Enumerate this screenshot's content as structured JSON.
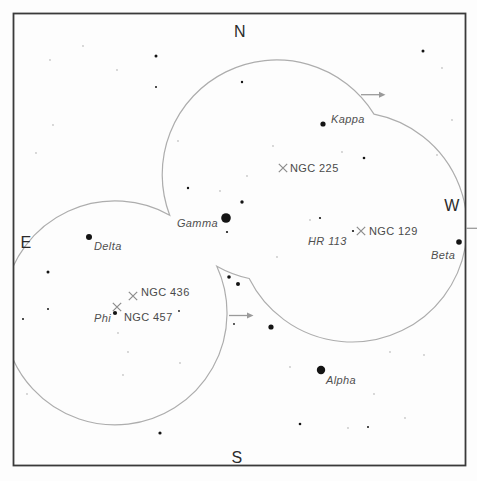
{
  "chart_title": "",
  "compass": {
    "north": "N",
    "south": "S",
    "east": "E",
    "west": "W"
  },
  "colors": {
    "background": "#fdfdfd",
    "border": "#3a3a3a",
    "fov_circle": "#adadad",
    "arrow": "#9a9a9a",
    "x_marker": "#8c8c8c",
    "star": "#141414",
    "faint_star": "#c6c6c6",
    "star_label": "#4f4f4f",
    "dso_label": "#4a4a4a",
    "compass_label": "#2b2b2b"
  },
  "fov": {
    "description": "three overlapping finder-field circles drawn as union outline",
    "circles": [
      {
        "cx": 273,
        "cy": 167,
        "r": 114
      },
      {
        "cx": 115,
        "cy": 313,
        "r": 112
      },
      {
        "cx": 352,
        "cy": 227,
        "r": 115
      }
    ],
    "outline_path": "M 169.7 215.2 A 114.5 114.5 0 0 1 374 114.1 A 115 115 0 1 1 249.2 278.5 A 114 114 0 0 1 216.8 266.2 A 112 112 0 1 1 169.7 215.2 Z"
  },
  "arrows": [
    {
      "x1": 361,
      "y1": 94.7,
      "x2": 379,
      "y2": 94.7,
      "head": true
    },
    {
      "x1": 229,
      "y1": 315.5,
      "x2": 247,
      "y2": 315.5,
      "head": true
    },
    {
      "x1": 466,
      "y1": 228.3,
      "x2": 477,
      "y2": 228.3,
      "head": false
    }
  ],
  "stars": {
    "bright": [
      {
        "x": 226,
        "y": 218,
        "r": 4.8
      },
      {
        "x": 321,
        "y": 370,
        "r": 4.2
      },
      {
        "x": 89,
        "y": 237,
        "r": 3.0
      },
      {
        "x": 459,
        "y": 242,
        "r": 2.8
      },
      {
        "x": 323,
        "y": 124,
        "r": 2.6
      },
      {
        "x": 271,
        "y": 327,
        "r": 2.6
      },
      {
        "x": 115,
        "y": 313,
        "r": 2.1
      },
      {
        "x": 238,
        "y": 284,
        "r": 2.0
      },
      {
        "x": 229,
        "y": 277,
        "r": 1.8
      },
      {
        "x": 242,
        "y": 202,
        "r": 1.7
      },
      {
        "x": 160,
        "y": 433,
        "r": 1.6
      },
      {
        "x": 48,
        "y": 272,
        "r": 1.5
      },
      {
        "x": 156,
        "y": 56,
        "r": 1.5
      },
      {
        "x": 423,
        "y": 51,
        "r": 1.5
      },
      {
        "x": 300,
        "y": 424,
        "r": 1.3
      },
      {
        "x": 364,
        "y": 158,
        "r": 1.3
      },
      {
        "x": 188,
        "y": 188,
        "r": 1.2
      },
      {
        "x": 242,
        "y": 82,
        "r": 1.2
      },
      {
        "x": 227,
        "y": 232,
        "r": 1.1
      },
      {
        "x": 320,
        "y": 218,
        "r": 1.1
      },
      {
        "x": 353,
        "y": 231,
        "r": 1.1
      },
      {
        "x": 156,
        "y": 87,
        "r": 1.0
      },
      {
        "x": 48,
        "y": 309,
        "r": 1.0
      },
      {
        "x": 23,
        "y": 319,
        "r": 1.0
      },
      {
        "x": 368,
        "y": 427,
        "r": 1.0
      },
      {
        "x": 179,
        "y": 311,
        "r": 0.9
      },
      {
        "x": 234,
        "y": 324,
        "r": 0.9
      }
    ],
    "faint": [
      [
        83,
        46
      ],
      [
        50,
        60
      ],
      [
        117,
        70
      ],
      [
        53,
        125
      ],
      [
        36,
        153
      ],
      [
        178,
        141
      ],
      [
        273,
        146
      ],
      [
        247,
        176
      ],
      [
        220,
        191
      ],
      [
        277,
        257
      ],
      [
        310,
        220
      ],
      [
        312,
        238
      ],
      [
        342,
        152
      ],
      [
        437,
        155
      ],
      [
        442,
        68
      ],
      [
        452,
        120
      ],
      [
        123,
        375
      ],
      [
        180,
        363
      ],
      [
        27,
        394
      ],
      [
        128,
        352
      ],
      [
        118,
        333
      ],
      [
        290,
        367
      ],
      [
        374,
        394
      ],
      [
        405,
        418
      ],
      [
        348,
        428
      ],
      [
        390,
        352
      ],
      [
        424,
        355
      ]
    ]
  },
  "star_labels": [
    {
      "text": "Kappa",
      "x": 331,
      "y": 123,
      "anchor": "start"
    },
    {
      "text": "Gamma",
      "x": 218,
      "y": 227,
      "anchor": "end"
    },
    {
      "text": "Delta",
      "x": 94,
      "y": 250,
      "anchor": "start"
    },
    {
      "text": "Beta",
      "x": 431,
      "y": 259,
      "anchor": "start"
    },
    {
      "text": "Alpha",
      "x": 326,
      "y": 384,
      "anchor": "start"
    },
    {
      "text": "Phi",
      "x": 111,
      "y": 322,
      "anchor": "end"
    },
    {
      "text": "HR 113",
      "x": 308,
      "y": 245,
      "anchor": "start"
    }
  ],
  "dso_markers": [
    {
      "label": "NGC 225",
      "x": 283,
      "y": 168,
      "lx": 290,
      "ly": 172
    },
    {
      "label": "NGC 129",
      "x": 361,
      "y": 231,
      "lx": 369,
      "ly": 235
    },
    {
      "label": "NGC 436",
      "x": 133,
      "y": 296,
      "lx": 141,
      "ly": 296
    },
    {
      "label": "NGC 457",
      "x": 117,
      "y": 307,
      "lx": 124,
      "ly": 321
    }
  ]
}
